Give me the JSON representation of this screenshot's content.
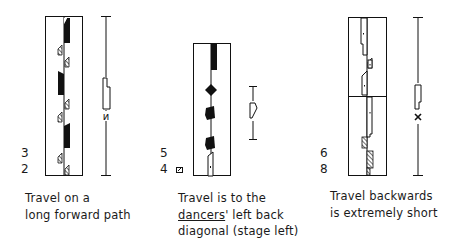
{
  "figures": [
    {
      "id": "left",
      "numbers": [
        "3",
        "2"
      ],
      "caption_lines": [
        "Travel on a",
        "long forward path"
      ],
      "path_sign": "short-path-sign"
    },
    {
      "id": "middle",
      "numbers": [
        "5",
        "4"
      ],
      "caption_lines": [
        "Travel is to the",
        "dancers",
        "' left back",
        "diagonal (stage left)"
      ],
      "path_sign": "left-back-diagonal-sign"
    },
    {
      "id": "right",
      "numbers": [
        "6",
        "8"
      ],
      "caption_lines": [
        "Travel backwards",
        "is extremely short"
      ],
      "path_sign": "extremely-short-sign"
    }
  ],
  "colors": {
    "ink": "#111111",
    "background": "#ffffff"
  }
}
